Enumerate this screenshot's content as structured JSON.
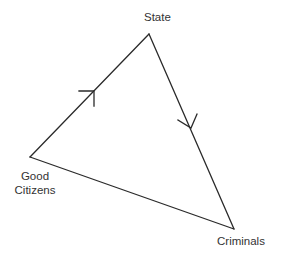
{
  "diagram": {
    "type": "directed-triangle",
    "nodes": [
      {
        "id": "state",
        "label": "State"
      },
      {
        "id": "good_citizens",
        "label_line1": "Good",
        "label_line2": "Citizens"
      },
      {
        "id": "criminals",
        "label": "Criminals"
      }
    ],
    "edges": [
      {
        "from": "good_citizens",
        "to": "state",
        "directed": true
      },
      {
        "from": "state",
        "to": "criminals",
        "directed": true
      },
      {
        "from": "good_citizens",
        "to": "criminals",
        "directed": false
      }
    ],
    "colors": {
      "line": "#2a2a2a",
      "text": "#333333",
      "background": "#ffffff"
    }
  },
  "labels": {
    "state": "State",
    "good_citizens_line1": "Good",
    "good_citizens_line2": "Citizens",
    "criminals": "Criminals"
  }
}
